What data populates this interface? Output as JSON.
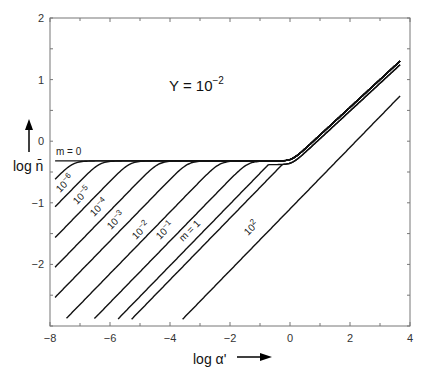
{
  "chart_data": {
    "type": "line",
    "title_main": "Y = 10",
    "title_exp": "−2",
    "xlabel": "log α'",
    "ylabel": "log n̄",
    "xlim": [
      -8,
      4
    ],
    "ylim": [
      -3,
      2
    ],
    "x_ticks": [
      -8,
      -6,
      -4,
      -2,
      0,
      2,
      4
    ],
    "x_tick_labels": [
      "−8",
      "−6",
      "−4",
      "−2",
      "0",
      "2",
      "4"
    ],
    "y_ticks": [
      -2,
      -1,
      0,
      1,
      2
    ],
    "y_tick_labels": [
      "−2",
      "−1",
      "0",
      "1",
      "2"
    ],
    "grid": false,
    "legend": "inline labels on curves",
    "plateau": -0.32,
    "series": [
      {
        "name": "m = 0",
        "label_base": "m = 0",
        "label_exp": "",
        "intercept": 9.0,
        "x_start": -7.83
      },
      {
        "name": "10^-6",
        "label_base": "10",
        "label_exp": "−6",
        "intercept": 3.3,
        "x_start": -7.83
      },
      {
        "name": "10^-5",
        "label_base": "10",
        "label_exp": "−5",
        "intercept": 2.85,
        "x_start": -7.83
      },
      {
        "name": "10^-4",
        "label_base": "10",
        "label_exp": "−4",
        "intercept": 2.35,
        "x_start": -7.83
      },
      {
        "name": "10^-3",
        "label_base": "10",
        "label_exp": "−3",
        "intercept": 1.87,
        "x_start": -7.83
      },
      {
        "name": "10^-2",
        "label_base": "10",
        "label_exp": "−2",
        "intercept": 1.38,
        "x_start": -7.83
      },
      {
        "name": "10^-1",
        "label_base": "10",
        "label_exp": "−1",
        "intercept": 0.85,
        "x_start": -7.5
      },
      {
        "name": "m = 1",
        "label_base": "m = 1",
        "label_exp": "",
        "intercept": 0.38,
        "x_start": -6.57
      },
      {
        "name": "10",
        "label_base": "10",
        "label_exp": "",
        "intercept": -0.02,
        "x_start": -5.83
      },
      {
        "name": "10^1.5",
        "label_base": "",
        "label_exp": "",
        "intercept": -0.25,
        "x_start": -5.33
      },
      {
        "name": "10^2",
        "label_base": "10",
        "label_exp": "2",
        "intercept": -1.1,
        "x_start": -3.73
      }
    ],
    "upper_curves_end_values": [
      1.23,
      1.17,
      0.73
    ],
    "x_end": 3.67
  }
}
